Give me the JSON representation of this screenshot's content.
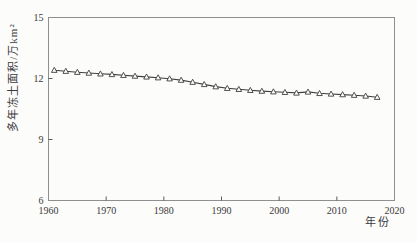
{
  "chart_data": {
    "type": "line",
    "title": "",
    "xlabel": "年份",
    "ylabel": "多年冻土面积/万km²",
    "xlim": [
      1960,
      2020
    ],
    "ylim": [
      6,
      15
    ],
    "xticks": [
      1960,
      1970,
      1980,
      1990,
      2000,
      2010,
      2020
    ],
    "yticks": [
      6,
      9,
      12,
      15
    ],
    "grid": false,
    "legend_position": "none",
    "marker": "open-triangle-up",
    "line_color": "#3f3f3f",
    "marker_fill": "#fcfcfa",
    "frame_color": "#8f8f8f",
    "tick_color": "#5a5a5a",
    "text_color": "#3a3a3a",
    "background": "#fcfcfa",
    "series": [
      {
        "name": "多年冻土面积",
        "x": [
          1961,
          1963,
          1965,
          1967,
          1969,
          1971,
          1973,
          1975,
          1977,
          1979,
          1981,
          1983,
          1985,
          1987,
          1989,
          1991,
          1993,
          1995,
          1997,
          1999,
          2001,
          2003,
          2005,
          2007,
          2009,
          2011,
          2013,
          2015,
          2017
        ],
        "values": [
          12.41,
          12.36,
          12.31,
          12.27,
          12.23,
          12.2,
          12.16,
          12.12,
          12.08,
          12.04,
          11.99,
          11.92,
          11.82,
          11.71,
          11.6,
          11.52,
          11.47,
          11.42,
          11.38,
          11.35,
          11.32,
          11.29,
          11.34,
          11.27,
          11.24,
          11.21,
          11.18,
          11.14,
          11.08
        ]
      }
    ]
  }
}
